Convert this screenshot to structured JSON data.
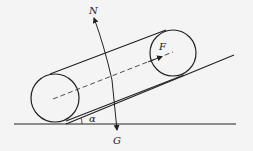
{
  "diagram": {
    "labels": {
      "normal_force": "N",
      "applied_force": "F",
      "gravity": "G",
      "angle": "α"
    },
    "colors": {
      "background": "#f4f4f4",
      "stroke": "#222222"
    }
  }
}
